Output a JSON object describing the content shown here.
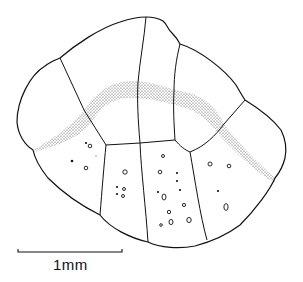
{
  "figure": {
    "ink_color": "#111111",
    "background": "#ffffff",
    "plates": {
      "upper_row": 5,
      "lower_row": 5
    },
    "pores": {
      "open_circles": 22,
      "filled_dots": 8
    }
  },
  "scale_bar": {
    "label": "1mm",
    "length_px": 104
  }
}
